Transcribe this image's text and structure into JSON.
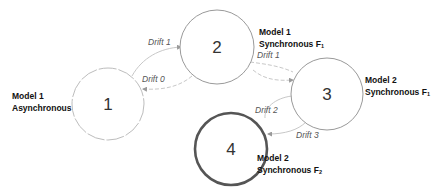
{
  "diagram": {
    "type": "state-transition",
    "nodes": [
      {
        "id": "1",
        "label": "1",
        "model_line1": "Model 1",
        "model_line2": "Asynchronous",
        "subscript": "",
        "border": "light-dashed"
      },
      {
        "id": "2",
        "label": "2",
        "model_line1": "Model 1",
        "model_line2": "Synchronous F",
        "subscript": "1",
        "border": "thin"
      },
      {
        "id": "3",
        "label": "3",
        "model_line1": "Model 2",
        "model_line2": "Synchronous F",
        "subscript": "1",
        "border": "thin"
      },
      {
        "id": "4",
        "label": "4",
        "model_line1": "Model 2",
        "model_line2": "Synchronous F",
        "subscript": "2",
        "border": "thick"
      }
    ],
    "edges": [
      {
        "from": "1",
        "to": "2",
        "label": "Drift 1"
      },
      {
        "from": "2",
        "to": "1",
        "label": "Drift 0"
      },
      {
        "from": "2",
        "to": "3",
        "label": "Drift 1"
      },
      {
        "from": "3",
        "to": "4",
        "label": "Drift 2"
      },
      {
        "from": "3",
        "to": "4",
        "label": "Drift 3"
      }
    ]
  },
  "colors": {
    "thin_border": "#9a9a9a",
    "thick_border": "#555555",
    "edge": "#c8c8c8",
    "text": "#111111"
  }
}
